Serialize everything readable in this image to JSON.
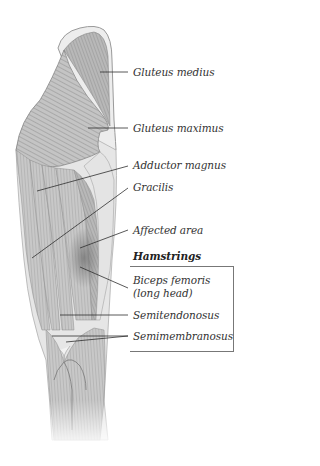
{
  "figure": {
    "labels": {
      "gluteus_medius": "Gluteus medius",
      "gluteus_maximus": "Gluteus maximus",
      "adductor_magnus": "Adductor magnus",
      "gracilis": "Gracilis",
      "affected_area": "Affected area",
      "hamstrings_heading": "Hamstrings",
      "biceps_femoris_line1": "Biceps femoris",
      "biceps_femoris_line2": "(long head)",
      "semitendonosus": "Semitendonosus",
      "semimembranosus": "Semimembranosus"
    },
    "colors": {
      "muscle_light": "#d6d6d6",
      "muscle_mid": "#a8a8a8",
      "muscle_dark": "#7a7a7a",
      "affected_shade": "#8a8a8a",
      "leader_line": "#333333",
      "text": "#333333"
    }
  }
}
